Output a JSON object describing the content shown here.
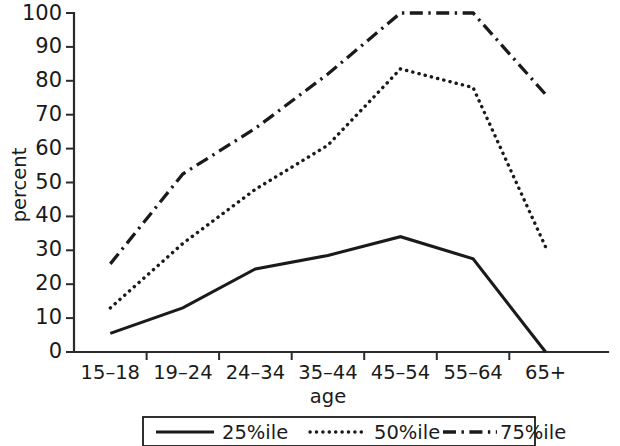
{
  "chart_data": {
    "type": "line",
    "title": "",
    "xlabel": "age",
    "ylabel": "percent",
    "categories": [
      "15–18",
      "19–24",
      "24–34",
      "35–44",
      "45–54",
      "55–64",
      "65+"
    ],
    "ylim": [
      0,
      100
    ],
    "yticks": [
      0,
      10,
      20,
      30,
      40,
      50,
      60,
      70,
      80,
      90,
      100
    ],
    "ytick_labels": [
      "0",
      "10",
      "20",
      "30",
      "40",
      "50",
      "60",
      "70",
      "80",
      "90",
      "100"
    ],
    "grid": false,
    "legend_position": "below-axis",
    "series": [
      {
        "name": "25%ile",
        "style": "solid",
        "color": "#1a1a1a",
        "values": [
          5.5,
          13,
          24.5,
          28.5,
          34,
          27.5,
          0
        ]
      },
      {
        "name": "50%ile",
        "style": "dotted",
        "color": "#1a1a1a",
        "values": [
          13,
          32,
          48,
          61,
          83.5,
          78,
          31
        ]
      },
      {
        "name": "75%ile",
        "style": "dash-dot",
        "color": "#1a1a1a",
        "values": [
          26,
          52.5,
          66,
          82,
          100,
          100,
          76
        ]
      }
    ]
  },
  "axes": {
    "y_label": "percent",
    "x_label": "age",
    "y_tick_0": "0",
    "y_tick_1": "10",
    "y_tick_2": "20",
    "y_tick_3": "30",
    "y_tick_4": "40",
    "y_tick_5": "50",
    "y_tick_6": "60",
    "y_tick_7": "70",
    "y_tick_8": "80",
    "y_tick_9": "90",
    "y_tick_10": "100",
    "x_tick_0": "15–18",
    "x_tick_1": "19–24",
    "x_tick_2": "24–34",
    "x_tick_3": "35–44",
    "x_tick_4": "45–54",
    "x_tick_5": "55–64",
    "x_tick_6": "65+"
  },
  "legend": {
    "item_0_label": "25%ile",
    "item_1_label": "50%ile",
    "item_2_label": "75%ile"
  },
  "colors": {
    "ink": "#1a1a1a",
    "axis": "#2b2b2b",
    "background": "#ffffff"
  }
}
